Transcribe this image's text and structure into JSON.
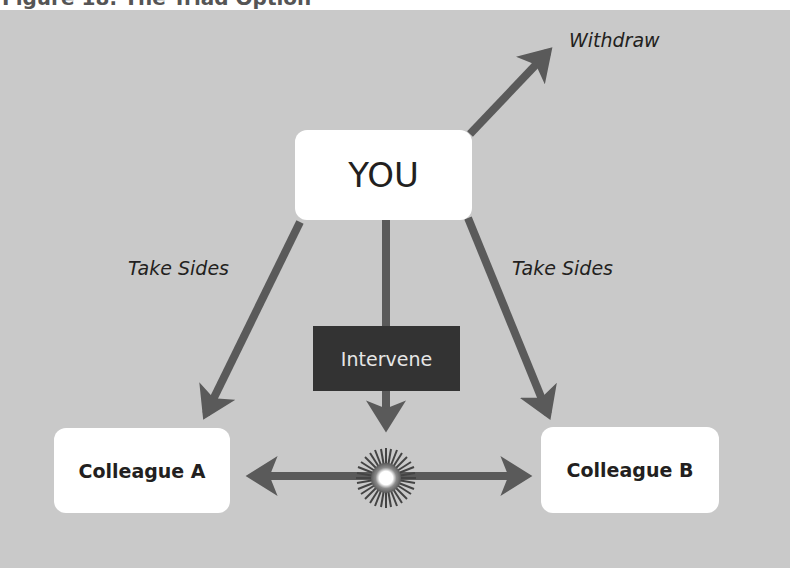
{
  "caption": {
    "text": "Figure 18: The Triad Option"
  },
  "diagram": {
    "nodes": {
      "you": "YOU",
      "colleague_a": "Colleague A",
      "colleague_b": "Colleague B",
      "intervene": "Intervene"
    },
    "edge_labels": {
      "withdraw": "Withdraw",
      "take_sides_left": "Take Sides",
      "take_sides_right": "Take Sides"
    },
    "colors": {
      "background": "#c9c9c9",
      "arrow": "#5a5a5a",
      "node_fill": "#ffffff",
      "intervene_fill": "#333333",
      "text": "#231f20"
    },
    "icons": [
      "conflict-burst-icon"
    ]
  }
}
